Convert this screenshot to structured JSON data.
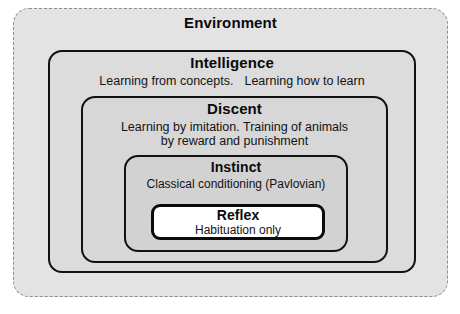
{
  "diagram": {
    "kind": "nested-containment-hierarchy",
    "levels": [
      {
        "id": "environment",
        "title": "Environment",
        "description": "",
        "fill": "#e3e3e3",
        "border_style": "dashed",
        "border_color": "#8d8d8d"
      },
      {
        "id": "intelligence",
        "title": "Intelligence",
        "description_part_1": "Learning from concepts.",
        "description_part_2": "Learning how to learn",
        "fill": "#dcdcdc",
        "border_style": "solid",
        "border_color": "#111111"
      },
      {
        "id": "discent",
        "title": "Discent",
        "description_line_1": "Learning by imitation. Training of animals",
        "description_line_2": "by reward and punishment",
        "fill": "#d7d7d7",
        "border_style": "solid",
        "border_color": "#111111"
      },
      {
        "id": "instinct",
        "title": "Instinct",
        "description": "Classical conditioning (Pavlovian)",
        "fill": "#d2d2d2",
        "border_style": "solid",
        "border_color": "#111111"
      },
      {
        "id": "reflex",
        "title": "Reflex",
        "description": "Habituation only",
        "fill": "#ffffff",
        "border_style": "solid",
        "border_color": "#0b0b0b"
      }
    ]
  }
}
